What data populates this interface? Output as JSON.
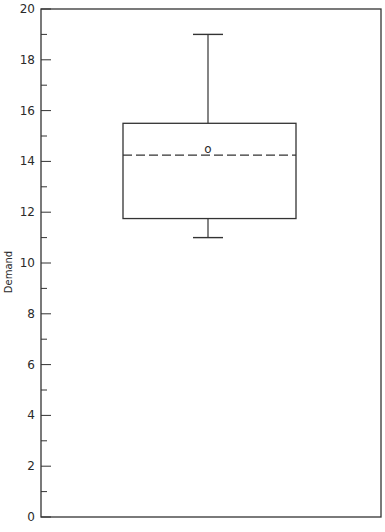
{
  "chart_data": {
    "type": "box",
    "title": "",
    "xlabel": "",
    "ylabel": "Demand",
    "ylim": [
      0,
      20
    ],
    "yticks_major": [
      0,
      2,
      4,
      6,
      8,
      10,
      12,
      14,
      16,
      18,
      20
    ],
    "yticks_minor": [
      1,
      3,
      5,
      7,
      9,
      11,
      13,
      15,
      17,
      19
    ],
    "ytick_labels": [
      "0",
      "2",
      "4",
      "6",
      "8",
      "10",
      "12",
      "14",
      "16",
      "18",
      "20"
    ],
    "grid": false,
    "legend": null,
    "series": [
      {
        "name": "Demand",
        "whisker_low": 11.0,
        "q1": 11.75,
        "median": 14.25,
        "q3": 15.5,
        "whisker_high": 19.0,
        "mean": 14.5,
        "mean_marker": "o",
        "median_style": "dashed"
      }
    ]
  }
}
